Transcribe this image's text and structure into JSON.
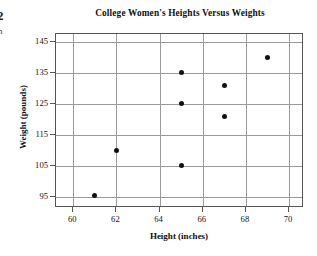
{
  "page_artifacts": {
    "page_number": "2",
    "clipped_glyph": "n"
  },
  "chart_data": {
    "type": "scatter",
    "title": "College Women's Heights Versus Weights",
    "xlabel": "Height (inches)",
    "ylabel": "Weight (pounds)",
    "xlim": [
      59.2,
      70.6
    ],
    "ylim": [
      92.0,
      147.5
    ],
    "xticks": [
      60,
      62,
      64,
      66,
      68,
      70
    ],
    "yticks": [
      95,
      105,
      115,
      125,
      135,
      145
    ],
    "xticklabels": [
      "60",
      "62",
      "64",
      "66",
      "68",
      "70"
    ],
    "yticklabels": [
      "95",
      "105",
      "115",
      "125",
      "135",
      "145"
    ],
    "grid": true,
    "grid_color": "#9a9a9a",
    "legend": null,
    "marker": "filled-circle",
    "marker_color": "#111111",
    "points": [
      {
        "x": 61,
        "y": 95.5
      },
      {
        "x": 62,
        "y": 110
      },
      {
        "x": 65,
        "y": 135
      },
      {
        "x": 65,
        "y": 125
      },
      {
        "x": 65,
        "y": 105
      },
      {
        "x": 67,
        "y": 131
      },
      {
        "x": 67,
        "y": 121
      },
      {
        "x": 69,
        "y": 140
      }
    ]
  }
}
